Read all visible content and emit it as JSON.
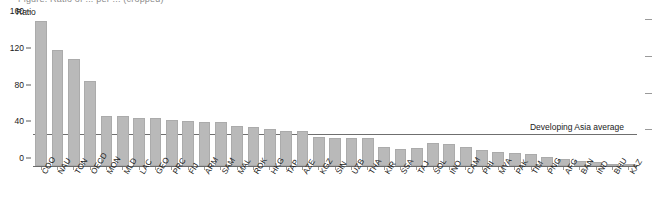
{
  "figure": {
    "cropped_title_fragment": "Figure:  Ratio of ... per ...  (cropped)",
    "ylabel": "Ratio"
  },
  "annotation": {
    "average_label": "Developing Asia average"
  },
  "chart_data": {
    "type": "bar",
    "title": "",
    "subtitle": "",
    "xlabel": "",
    "ylabel": "Ratio",
    "ylim": [
      0,
      160
    ],
    "yticks": [
      0,
      40,
      80,
      120,
      160
    ],
    "grid": false,
    "legend": false,
    "bar_color": "#b9b9b9",
    "reference_line": {
      "label": "Developing Asia average",
      "value": 35,
      "color": "#6f6f6f"
    },
    "categories": [
      "COO",
      "NAU",
      "TON",
      "OECD",
      "MON",
      "MLD",
      "LAC",
      "GEO",
      "PRC",
      "FIJ",
      "ARM",
      "SAM",
      "MAL",
      "ROK",
      "HKG",
      "TAP",
      "AZE",
      "KGZ",
      "SIN",
      "UZB",
      "THA",
      "KIR",
      "SSA",
      "TAJ",
      "SOL",
      "INO",
      "CAM",
      "PHI",
      "MYA",
      "PAK",
      "TIM",
      "PNG",
      "AFG",
      "BAN",
      "IND",
      "BHU",
      "KAZ"
    ],
    "values": [
      158,
      126,
      117,
      92,
      54,
      54,
      52,
      52,
      50,
      49,
      48,
      48,
      44,
      42,
      40,
      38,
      38,
      32,
      31,
      31,
      30,
      21,
      18,
      20,
      25,
      24,
      21,
      17,
      15,
      14,
      13,
      10,
      8,
      6,
      4,
      2,
      1
    ]
  }
}
